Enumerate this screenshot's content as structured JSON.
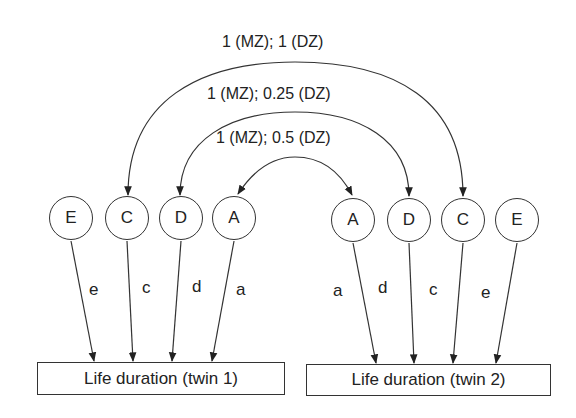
{
  "diagram": {
    "type": "twin ACDE path model",
    "correlations": [
      {
        "label": "1 (MZ); 1 (DZ)",
        "between": "C",
        "heads": "single-each-end"
      },
      {
        "label": "1 (MZ); 0.25 (DZ)",
        "between": "D",
        "heads": "single-each-end"
      },
      {
        "label": "1 (MZ); 0.5 (DZ)",
        "between": "A",
        "heads": "double"
      }
    ],
    "twin1": {
      "latent_factors": [
        "E",
        "C",
        "D",
        "A"
      ],
      "path_labels": [
        "e",
        "c",
        "d",
        "a"
      ],
      "outcome": "Life duration (twin 1)"
    },
    "twin2": {
      "latent_factors": [
        "A",
        "D",
        "C",
        "E"
      ],
      "path_labels": [
        "a",
        "d",
        "c",
        "e"
      ],
      "outcome": "Life duration (twin 2)"
    }
  }
}
